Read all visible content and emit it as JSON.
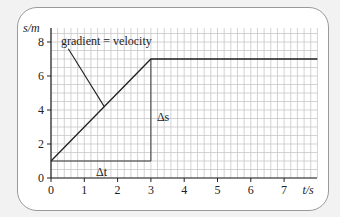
{
  "chart_data": {
    "type": "line",
    "title": "",
    "xlabel": "t/s",
    "ylabel": "s/m",
    "xlim": [
      0,
      8
    ],
    "ylim": [
      0,
      9
    ],
    "x_ticks": [
      "0",
      "1",
      "2",
      "3",
      "4",
      "5",
      "6",
      "7"
    ],
    "y_ticks": [
      "0",
      "2",
      "4",
      "6",
      "8"
    ],
    "grid": true,
    "series": [
      {
        "name": "displacement",
        "x": [
          0,
          3,
          8
        ],
        "y": [
          1,
          7,
          7
        ]
      }
    ],
    "annotations": [
      {
        "text": "gradient = velocity",
        "x": 0.95,
        "y": 8.0
      },
      {
        "text": "Δs",
        "x": 3.25,
        "y": 3.6
      },
      {
        "text": "Δt",
        "x": 1.55,
        "y": 0.4
      }
    ],
    "construction": {
      "delta_t": {
        "from": 0,
        "to": 3,
        "y": 1
      },
      "delta_s": {
        "x": 3,
        "from": 1,
        "to": 7
      }
    }
  },
  "labels": {
    "y_axis": "s/m",
    "x_axis": "t/s",
    "gradient": "gradient = velocity",
    "delta_s": "Δs",
    "delta_t": "Δt"
  }
}
